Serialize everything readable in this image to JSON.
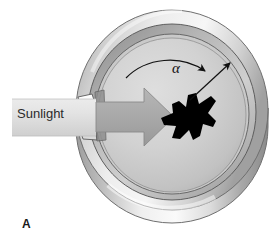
{
  "figure": {
    "panel_label": "A",
    "caption_text": "",
    "background_color": "#ffffff"
  },
  "labels": {
    "sunlight": "Sunlight",
    "angle_symbol": "α"
  },
  "colors": {
    "ink": "#111111",
    "panel_label": "#1a1a1a",
    "beam_light": "#e6e6e6",
    "beam_dark": "#c9c9c9",
    "arrow_fill": "#a9a9a9",
    "arrow_stroke": "#8c8c8c",
    "cage_floor_light": "#d8d8d8",
    "cage_floor_dark": "#b4b4b4",
    "rim_light": "#f2f2f2",
    "rim_mid": "#c4c4c4",
    "rim_dark": "#8f8f8f",
    "wall_light": "#f5f5f5",
    "wall_dark": "#9a9a9a",
    "bird": "#000000",
    "outline": "#555555"
  },
  "elements": {
    "cage": "circular orientation cage, oblique view",
    "rim": "cylinder rim band",
    "wall": "cylinder outer wall",
    "floor": "cage floor disc",
    "slit": "light entry slit on left wall",
    "beam": "sunlight beam band",
    "beam_arrow": "block arrow pointing right into cage",
    "bird": "black bird silhouette",
    "angle_arc": "curved arrow spanning angle alpha",
    "heading_arrow": "straight radial arrow indicating bird heading"
  }
}
